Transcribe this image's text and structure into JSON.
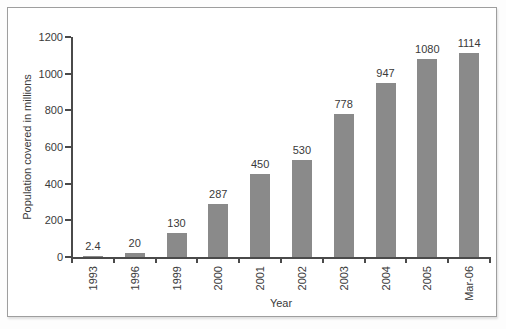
{
  "chart_data": {
    "type": "bar",
    "categories": [
      "1993",
      "1996",
      "1999",
      "2000",
      "2001",
      "2002",
      "2003",
      "2004",
      "2005",
      "Mar-06"
    ],
    "values": [
      2.4,
      20,
      130,
      287,
      450,
      530,
      778,
      947,
      1080,
      1114
    ],
    "value_labels": [
      "2.4",
      "20",
      "130",
      "287",
      "450",
      "530",
      "778",
      "947",
      "1080",
      "1114"
    ],
    "title": "",
    "xlabel": "Year",
    "ylabel": "Population covered in millions",
    "ylim": [
      0,
      1200
    ],
    "yticks": [
      0,
      200,
      400,
      600,
      800,
      1000,
      1200
    ],
    "grid": false,
    "legend_position": "none",
    "bar_color": "#8a8a8a",
    "axis_color": "#4a4a4a",
    "text_color": "#3a3a3a",
    "frame_border_color": "#9e9e9e"
  }
}
